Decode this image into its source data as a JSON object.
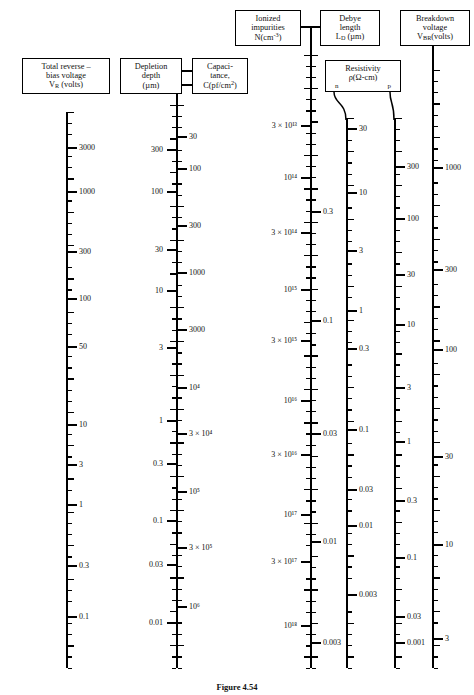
{
  "figure": {
    "caption": "Figure 4.54",
    "type": "nomograph"
  },
  "boxes": {
    "vr": {
      "name": "total-reverse-bias-voltage",
      "lines": [
        "Total reverse –",
        "bias voltage",
        "V_R (volts)"
      ]
    },
    "depl": {
      "name": "depletion-depth",
      "lines": [
        "Depletion",
        "depth",
        "(µm)"
      ]
    },
    "cap": {
      "name": "capacitance",
      "lines": [
        "Capaci-",
        "tance,",
        "C(pf/cm²)"
      ]
    },
    "ion": {
      "name": "ionized-impurities",
      "lines": [
        "Ionized",
        "impurities",
        "N(cm⁻³)"
      ]
    },
    "debye": {
      "name": "debye-length",
      "lines": [
        "Debye",
        "length",
        "L_D (µm)"
      ]
    },
    "res": {
      "name": "resistivity",
      "lines": [
        "Resistivity",
        "ρ(Ω-cm)"
      ],
      "sub_n": "n",
      "sub_p": "p"
    },
    "bv": {
      "name": "breakdown-voltage",
      "lines": [
        "Breakdown",
        "voltage",
        "V_BR(volts)"
      ]
    }
  },
  "chart_data": {
    "type": "nomograph-log-scales",
    "title": "Figure 4.54",
    "scales": [
      {
        "id": "vr",
        "name": "Total reverse-bias voltage",
        "unit": "volts",
        "side": "right",
        "axis_x": 66,
        "y_top": 112,
        "y_bottom": 668,
        "labels": [
          "3000",
          "1000",
          "300",
          "100",
          "50",
          "10",
          "3",
          "1",
          "0.3",
          "0.1"
        ],
        "label_y": [
          148,
          192,
          252,
          299,
          347,
          425,
          465,
          505,
          566,
          617
        ]
      },
      {
        "id": "depletion",
        "name": "Depletion depth",
        "unit": "µm",
        "side": "left",
        "axis_x": 176,
        "y_top": 105,
        "y_bottom": 668,
        "labels": [
          "300",
          "100",
          "30",
          "10",
          "3",
          "1",
          "0.3",
          "0.1",
          "0.03",
          "0.01"
        ],
        "label_y": [
          150,
          192,
          250,
          291,
          348,
          421,
          464,
          521,
          565,
          623
        ]
      },
      {
        "id": "capacitance",
        "name": "Capacitance",
        "unit": "pf/cm²",
        "side": "right",
        "axis_x": 176,
        "y_top": 105,
        "y_bottom": 668,
        "labels": [
          "30",
          "100",
          "300",
          "1000",
          "3000",
          "10⁴",
          "3 × 10⁴",
          "10⁵",
          "3 × 10⁵",
          "10⁶"
        ],
        "label_y": [
          137,
          169,
          226,
          273,
          330,
          388,
          434,
          492,
          548,
          607
        ]
      },
      {
        "id": "impurities",
        "name": "Ionized impurities",
        "unit": "cm⁻³",
        "side": "left",
        "axis_x": 310,
        "y_top": 55,
        "y_bottom": 668,
        "labels": [
          "3 × 10¹³",
          "10¹⁴",
          "3 × 10¹⁴",
          "10¹⁵",
          "3 × 10¹⁵",
          "10¹⁶",
          "3 × 10¹⁶",
          "10¹⁷",
          "3 × 10¹⁷",
          "10¹⁸"
        ],
        "label_y": [
          126,
          178,
          233,
          290,
          341,
          401,
          455,
          515,
          562,
          626
        ]
      },
      {
        "id": "debye",
        "name": "Debye length",
        "unit": "µm",
        "side": "right",
        "axis_x": 310,
        "y_top": 55,
        "y_bottom": 668,
        "labels": [
          "0.3",
          "0.1",
          "0.03",
          "0.01",
          "0.003"
        ],
        "label_y": [
          212,
          321,
          434,
          542,
          643
        ]
      },
      {
        "id": "rho_n",
        "name": "Resistivity n-type",
        "unit": "Ω-cm",
        "side": "right",
        "axis_x": 346,
        "y_top": 118,
        "y_bottom": 668,
        "labels": [
          "30",
          "10",
          "3",
          "1",
          "0.3",
          "0.1",
          "0.03",
          "0.01",
          "0.003"
        ],
        "label_y": [
          129,
          193,
          251,
          311,
          349,
          430,
          490,
          526,
          595
        ]
      },
      {
        "id": "rho_p",
        "name": "Resistivity p-type",
        "unit": "Ω-cm",
        "side": "right",
        "axis_x": 394,
        "y_top": 118,
        "y_bottom": 668,
        "labels": [
          "300",
          "100",
          "30",
          "10",
          "3",
          "1",
          "0.3",
          "0.1",
          "0.03",
          "0.001"
        ],
        "label_y": [
          167,
          219,
          275,
          325,
          388,
          442,
          501,
          558,
          617,
          643
        ]
      },
      {
        "id": "breakdown",
        "name": "Breakdown voltage",
        "unit": "volts",
        "side": "right",
        "axis_x": 432,
        "y_top": 70,
        "y_bottom": 668,
        "labels": [
          "1000",
          "300",
          "100",
          "300",
          "30",
          "10",
          "3"
        ],
        "label_y": [
          168,
          270,
          350,
          0,
          457,
          545,
          639
        ]
      }
    ],
    "axis_type": "logarithmic",
    "grid": false,
    "legend": "none"
  }
}
